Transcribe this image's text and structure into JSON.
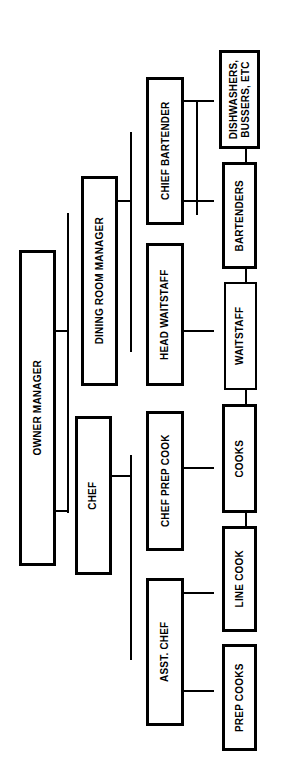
{
  "diagram": {
    "orientation": "rotated-90-ccw",
    "colors": {
      "background": "#ffffff",
      "box_fill": "#ffffff",
      "box_border": "#000000",
      "text": "#000000",
      "connector": "#000000"
    },
    "nodes": [
      {
        "id": "owner_manager",
        "label": "OWNER            MANAGER",
        "level": 1
      },
      {
        "id": "dining_room_manager",
        "label": "DINING ROOM MANAGER",
        "level": 2
      },
      {
        "id": "chef",
        "label": "CHEF",
        "level": 2
      },
      {
        "id": "chief_bartender",
        "label": "CHIEF BARTENDER",
        "level": 3
      },
      {
        "id": "head_waitstaff",
        "label": "HEAD WAITSTAFF",
        "level": 3
      },
      {
        "id": "chef_prep_cook",
        "label": "CHEF PREP COOK",
        "level": 3
      },
      {
        "id": "asst_chef",
        "label": "ASST. CHEF",
        "level": 3
      },
      {
        "id": "dishwashers",
        "label": "DISHWASHERS,\nBUSSERS, ETC",
        "level": 4
      },
      {
        "id": "bartenders",
        "label": "BARTENDERS",
        "level": 4
      },
      {
        "id": "waitstaff",
        "label": "WAITSTAFF",
        "level": 4
      },
      {
        "id": "cooks",
        "label": "COOKS",
        "level": 4
      },
      {
        "id": "line_cook",
        "label": "LINE COOK",
        "level": 4
      },
      {
        "id": "prep_cooks",
        "label": "PREP COOKS",
        "level": 4
      }
    ],
    "labels": {
      "owner": "OWNER",
      "manager": "MANAGER",
      "dining_room_manager": "DINING ROOM MANAGER",
      "chef": "CHEF",
      "chief_bartender": "CHIEF BARTENDER",
      "head_waitstaff": "HEAD WAITSTAFF",
      "chef_prep_cook": "CHEF PREP COOK",
      "asst_chef": "ASST. CHEF",
      "dishwashers_bussers": "DISHWASHERS,\nBUSSERS, ETC",
      "bartenders": "BARTENDERS",
      "waitstaff": "WAITSTAFF",
      "cooks": "COOKS",
      "line_cook": "LINE COOK",
      "prep_cooks": "PREP COOKS"
    },
    "edges": [
      {
        "from": "owner_manager",
        "to": "dining_room_manager"
      },
      {
        "from": "owner_manager",
        "to": "chef"
      },
      {
        "from": "dining_room_manager",
        "to": "chief_bartender"
      },
      {
        "from": "dining_room_manager",
        "to": "head_waitstaff"
      },
      {
        "from": "chef",
        "to": "chef_prep_cook"
      },
      {
        "from": "chef",
        "to": "asst_chef"
      },
      {
        "from": "chief_bartender",
        "to": "dishwashers"
      },
      {
        "from": "chief_bartender",
        "to": "bartenders"
      },
      {
        "from": "head_waitstaff",
        "to": "waitstaff"
      },
      {
        "from": "chef_prep_cook",
        "to": "cooks"
      },
      {
        "from": "asst_chef",
        "to": "line_cook"
      },
      {
        "from": "asst_chef",
        "to": "prep_cooks"
      }
    ]
  }
}
